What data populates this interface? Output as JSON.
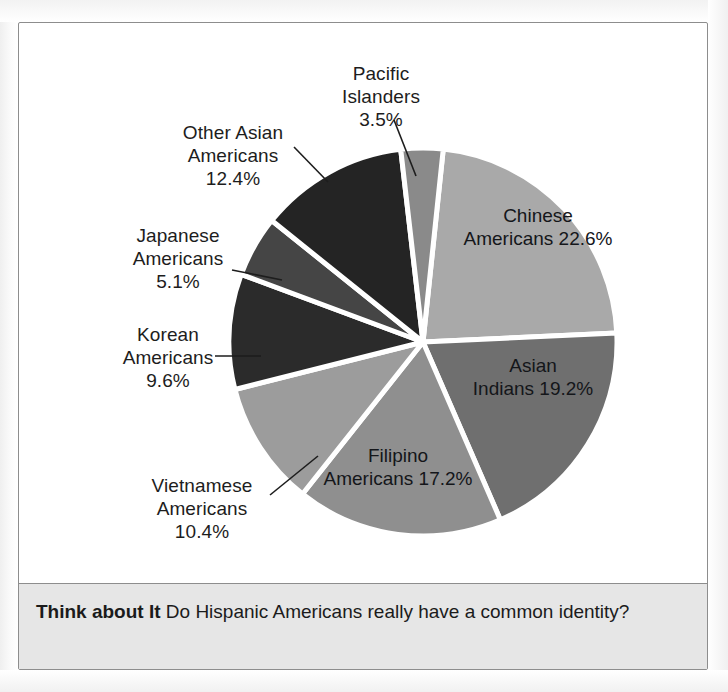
{
  "figure": {
    "background_color": "#ffffff",
    "frame_color": "#8d8d8d"
  },
  "chart_data": {
    "type": "pie",
    "title": "",
    "subtitle": "",
    "xlabel": "",
    "ylabel": "",
    "legend_position": "none",
    "grid": false,
    "units": "percent",
    "start_angle_deg": 6,
    "direction": "clockwise",
    "categories": [
      "Chinese Americans",
      "Asian Indians",
      "Filipino Americans",
      "Vietnamese Americans",
      "Korean Americans",
      "Japanese Americans",
      "Other Asian Americans",
      "Pacific Islanders"
    ],
    "values": [
      22.6,
      19.2,
      17.2,
      10.4,
      9.6,
      5.1,
      12.4,
      3.5
    ],
    "colors": [
      "#a9a9a9",
      "#6f6f6f",
      "#8f8f8f",
      "#9c9c9c",
      "#2b2b2b",
      "#454545",
      "#242424",
      "#8a8a8a"
    ],
    "slices": [
      {
        "label": "Chinese Americans",
        "value": 22.6,
        "value_text": "22.6%",
        "color": "#a9a9a9",
        "label_placement": "inside"
      },
      {
        "label": "Asian Indians",
        "value": 19.2,
        "value_text": "19.2%",
        "color": "#6f6f6f",
        "label_placement": "inside"
      },
      {
        "label": "Filipino Americans",
        "value": 17.2,
        "value_text": "17.2%",
        "color": "#8f8f8f",
        "label_placement": "inside"
      },
      {
        "label": "Vietnamese Americans",
        "value": 10.4,
        "value_text": "10.4%",
        "color": "#9c9c9c",
        "label_placement": "callout"
      },
      {
        "label": "Korean Americans",
        "value": 9.6,
        "value_text": "9.6%",
        "color": "#2b2b2b",
        "label_placement": "callout"
      },
      {
        "label": "Japanese Americans",
        "value": 5.1,
        "value_text": "5.1%",
        "color": "#454545",
        "label_placement": "callout"
      },
      {
        "label": "Other Asian Americans",
        "value": 12.4,
        "value_text": "12.4%",
        "color": "#242424",
        "label_placement": "callout"
      },
      {
        "label": "Pacific Islanders",
        "value": 3.5,
        "value_text": "3.5%",
        "color": "#8a8a8a",
        "label_placement": "callout"
      }
    ]
  },
  "labels": {
    "pacific_islanders": {
      "line1": "Pacific",
      "line2": "Islanders",
      "pct": "3.5%"
    },
    "other_asian": {
      "line1": "Other Asian",
      "line2": "Americans",
      "pct": "12.4%"
    },
    "japanese": {
      "line1": "Japanese",
      "line2": "Americans",
      "pct": "5.1%"
    },
    "korean": {
      "line1": "Korean",
      "line2": "Americans",
      "pct": "9.6%"
    },
    "vietnamese": {
      "line1": "Vietnamese",
      "line2": "Americans",
      "pct": "10.4%"
    },
    "filipino": {
      "line1": "Filipino",
      "line2": "Americans",
      "pct": "17.2%"
    },
    "asian_indians": {
      "line1": "Asian",
      "line2": "Indians",
      "pct": "19.2%"
    },
    "chinese": {
      "line1": "Chinese",
      "line2": "Americans",
      "pct": "22.6%"
    }
  },
  "caption": {
    "heading": "Think about It",
    "body": "Do Hispanic Americans really have a common identity?"
  }
}
